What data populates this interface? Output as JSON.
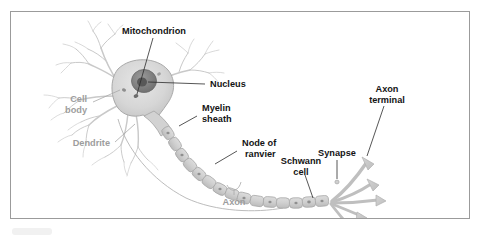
{
  "figure": {
    "panel_border_color": "#9b9b9b",
    "background_color": "#ffffff",
    "label_color_primary": "#141414",
    "label_color_secondary": "#9d9d9d",
    "cell_fill_color": "#d8d8d8",
    "cell_stroke_color": "#a9a9a9",
    "nucleus_color": "#8a8a8a",
    "nucleolus_color": "#5e5e5e"
  },
  "labels": {
    "mitochondrion": "Mitochondrion",
    "nucleus": "Nucleus",
    "cell_body_line1": "Cell",
    "cell_body_line2": "body",
    "dendrite": "Dendrite",
    "myelin_line1": "Myelin",
    "myelin_line2": "sheath",
    "node_line1": "Node of",
    "node_line2": "ranvier",
    "schwann_line1": "Schwann",
    "schwann_line2": "cell",
    "synapse": "Synapse",
    "axon_terminal_line1": "Axon",
    "axon_terminal_line2": "terminal",
    "axon": "Axon"
  },
  "structures": {
    "soma": "cell-body-soma",
    "nucleus": "nucleus-organelle",
    "nucleolus": "nucleolus",
    "mitochondrion": "mitochondrion-organelle",
    "dendrites": "dendrite-branches",
    "axon": "axon-fiber",
    "myelin_segments": "myelin-sheath-segments",
    "nodes_of_ranvier": "nodes-of-ranvier-gaps",
    "schwann_cell": "schwann-cell",
    "axon_terminals": "axon-terminal-branches",
    "synapse": "synapse-point"
  },
  "myelin_segment_count": 15,
  "terminal_branch_count": 5
}
